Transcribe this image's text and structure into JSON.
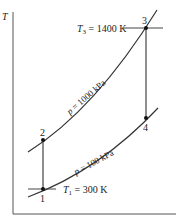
{
  "diagram": {
    "type": "T-s diagram",
    "y_axis_label": "T",
    "points": [
      {
        "id": "1",
        "label": "1"
      },
      {
        "id": "2",
        "label": "2"
      },
      {
        "id": "3",
        "label": "3"
      },
      {
        "id": "4",
        "label": "4"
      }
    ],
    "isobars": [
      {
        "p_label": "p",
        "value_label": " = 1000 kPa"
      },
      {
        "p_label": "p",
        "value_label": " = 100 kPa"
      }
    ],
    "temperatures": [
      {
        "sym": "T",
        "sub": "3",
        "value": " = 1400 K"
      },
      {
        "sym": "T",
        "sub": "1",
        "value": " = 300 K"
      }
    ],
    "colors": {
      "line": "#333333",
      "text": "#222222"
    }
  }
}
